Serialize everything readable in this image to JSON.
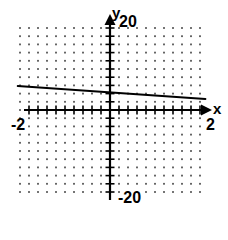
{
  "figure": {
    "width": 228,
    "height": 220,
    "background": "#ffffff",
    "ink_color": "#000000",
    "grid_dot_color": "#555555"
  },
  "labels": {
    "y_axis_name": "y",
    "x_axis_name": "x",
    "y_max": "20",
    "y_min": "-20",
    "x_max": "2",
    "x_min": "-2"
  },
  "chart_data": {
    "type": "line",
    "title": "",
    "xlabel": "x",
    "ylabel": "y",
    "xlim": [
      -2,
      2
    ],
    "ylim": [
      -20,
      20
    ],
    "xticks": [
      -2,
      -1.8,
      -1.6,
      -1.4,
      -1.2,
      -1,
      -0.8,
      -0.6,
      -0.4,
      -0.2,
      0,
      0.2,
      0.4,
      0.6,
      0.8,
      1,
      1.2,
      1.4,
      1.6,
      1.8,
      2
    ],
    "yticks": [
      -20,
      -18,
      -16,
      -14,
      -12,
      -10,
      -8,
      -6,
      -4,
      -2,
      0,
      2,
      4,
      6,
      8,
      10,
      12,
      14,
      16,
      18,
      20
    ],
    "xtick_labels": [
      "-2",
      "2"
    ],
    "ytick_labels": [
      "-20",
      "20"
    ],
    "grid": "dotted",
    "grid_on": true,
    "legend": "none",
    "series": [
      {
        "name": "line",
        "x": [
          -2,
          2
        ],
        "values": [
          5.8,
          2.8
        ],
        "slope": -0.75,
        "intercept": 4.3,
        "color": "#000000",
        "width": 2
      }
    ]
  }
}
